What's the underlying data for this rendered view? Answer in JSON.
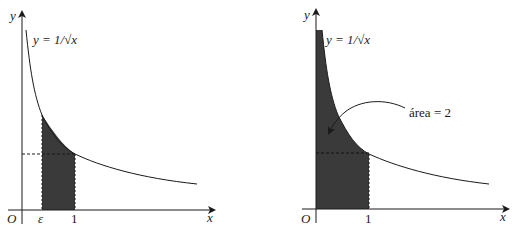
{
  "figure": {
    "left_panel": {
      "y_axis_label": "y",
      "x_axis_label": "x",
      "origin_label": "O",
      "function_label": "y = 1/√x",
      "tick_labels": [
        "ε",
        "1"
      ],
      "shaded_region": "ε ≤ x ≤ 1"
    },
    "right_panel": {
      "y_axis_label": "y",
      "x_axis_label": "x",
      "origin_label": "O",
      "function_label": "y = 1/√x",
      "tick_labels": [
        "1"
      ],
      "annotation": "área = 2",
      "shaded_region": "0 < x ≤ 1"
    },
    "colors": {
      "ink": "#1a1a1a",
      "shade": "#3a3a3a"
    }
  }
}
